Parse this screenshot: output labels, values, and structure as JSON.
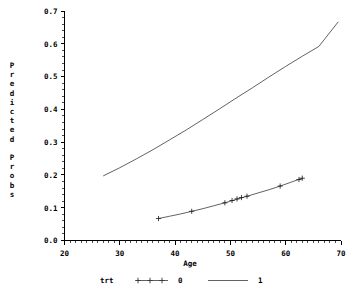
{
  "chart_data": {
    "type": "line",
    "title": "",
    "xlabel": "Age",
    "ylabel": "Predicted Probs",
    "xlim": [
      20,
      70
    ],
    "ylim": [
      0.0,
      0.7
    ],
    "xticks": [
      20,
      30,
      40,
      50,
      60,
      70
    ],
    "xtick_labels": [
      "20",
      "30",
      "40",
      "50",
      "60",
      "70"
    ],
    "yticks": [
      0.0,
      0.1,
      0.2,
      0.3,
      0.4,
      0.5,
      0.6,
      0.7
    ],
    "ytick_labels": [
      "0.0",
      "0.1",
      "0.2",
      "0.3",
      "0.4",
      "0.5",
      "0.6",
      "0.7"
    ],
    "grid": false,
    "legend_title": "trt",
    "legend_position": "bottom",
    "series": [
      {
        "name": "0",
        "style": "line-with-plus-markers",
        "color": "#3a3a3a",
        "x": [
          37.0,
          39.0,
          41.0,
          43.0,
          45.0,
          47.0,
          49.0,
          50.0,
          50.8,
          51.6,
          52.4,
          53.2,
          55.0,
          57.0,
          59.0,
          61.0,
          63.0
        ],
        "y": [
          0.067,
          0.074,
          0.081,
          0.089,
          0.097,
          0.106,
          0.115,
          0.12,
          0.124,
          0.128,
          0.132,
          0.136,
          0.145,
          0.155,
          0.166,
          0.178,
          0.19
        ],
        "marker_x": [
          37.0,
          43.0,
          49.0,
          50.3,
          51.2,
          52.0,
          53.0,
          59.0,
          62.4,
          63.0
        ],
        "marker_y": [
          0.067,
          0.089,
          0.115,
          0.122,
          0.127,
          0.131,
          0.135,
          0.166,
          0.186,
          0.19
        ]
      },
      {
        "name": "1",
        "style": "line",
        "color": "#3a3a3a",
        "x": [
          27.0,
          30.0,
          33.0,
          36.0,
          39.0,
          42.0,
          45.0,
          48.0,
          51.0,
          54.0,
          57.0,
          60.0,
          63.0,
          66.0,
          69.5
        ],
        "y": [
          0.197,
          0.222,
          0.249,
          0.277,
          0.307,
          0.337,
          0.369,
          0.401,
          0.434,
          0.466,
          0.499,
          0.531,
          0.562,
          0.592,
          0.667
        ]
      }
    ]
  },
  "legend": {
    "title": "trt",
    "entries": [
      {
        "label": "0",
        "symbol": "plus-markers"
      },
      {
        "label": "1",
        "symbol": "solid-line"
      }
    ]
  },
  "axes": {
    "x_title": "Age",
    "y_title": "Predicted Probs"
  }
}
